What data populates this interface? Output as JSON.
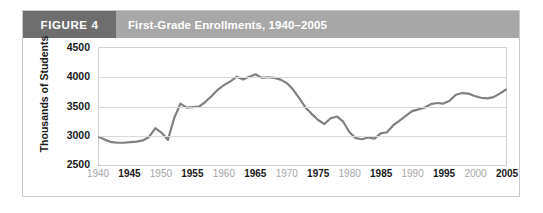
{
  "figure": {
    "tag": "FIGURE 4",
    "title": "First-Grade Enrollments, 1940–2005"
  },
  "chart_data": {
    "type": "line",
    "title": "First-Grade Enrollments, 1940–2005",
    "xlabel": "",
    "ylabel": "Thousands of Students",
    "ylim": [
      2500,
      4500
    ],
    "xlim": [
      1940,
      2005
    ],
    "yticks": [
      2500,
      3000,
      3500,
      4000,
      4500
    ],
    "ytick_labels": [
      "2500",
      "3000",
      "3500",
      "4000",
      "4500"
    ],
    "xticks": [
      1940,
      1945,
      1950,
      1955,
      1960,
      1965,
      1970,
      1975,
      1980,
      1985,
      1990,
      1995,
      2000,
      2005
    ],
    "xtick_labels": [
      "1940",
      "1945",
      "1950",
      "1955",
      "1960",
      "1965",
      "1970",
      "1975",
      "1980",
      "1985",
      "1990",
      "1995",
      "2000",
      "2005"
    ],
    "xtick_emphasis": [
      "minor",
      "major",
      "minor",
      "major",
      "minor",
      "major",
      "minor",
      "major",
      "minor",
      "major",
      "minor",
      "major",
      "minor",
      "major"
    ],
    "grid": true,
    "legend": false,
    "line_color": "#808080",
    "line_width": 3,
    "x": [
      1940,
      1941,
      1942,
      1943,
      1944,
      1945,
      1946,
      1947,
      1948,
      1949,
      1950,
      1951,
      1952,
      1953,
      1954,
      1955,
      1956,
      1957,
      1958,
      1959,
      1960,
      1961,
      1962,
      1963,
      1964,
      1965,
      1966,
      1967,
      1968,
      1969,
      1970,
      1971,
      1972,
      1973,
      1974,
      1975,
      1976,
      1977,
      1978,
      1979,
      1980,
      1981,
      1982,
      1983,
      1984,
      1985,
      1986,
      1987,
      1988,
      1989,
      1990,
      1991,
      1992,
      1993,
      1994,
      1995,
      1996,
      1997,
      1998,
      1999,
      2000,
      2001,
      2002,
      2003,
      2004,
      2005
    ],
    "y": [
      2980,
      2930,
      2890,
      2880,
      2880,
      2890,
      2900,
      2920,
      2980,
      3130,
      3050,
      2930,
      3300,
      3550,
      3480,
      3490,
      3500,
      3580,
      3680,
      3790,
      3870,
      3930,
      4010,
      3960,
      4010,
      4050,
      3990,
      4000,
      3990,
      3960,
      3900,
      3790,
      3640,
      3480,
      3370,
      3270,
      3200,
      3300,
      3330,
      3240,
      3060,
      2960,
      2940,
      2970,
      2950,
      3040,
      3060,
      3180,
      3260,
      3340,
      3420,
      3450,
      3480,
      3540,
      3560,
      3550,
      3600,
      3700,
      3730,
      3720,
      3680,
      3650,
      3640,
      3660,
      3720,
      3790
    ]
  }
}
